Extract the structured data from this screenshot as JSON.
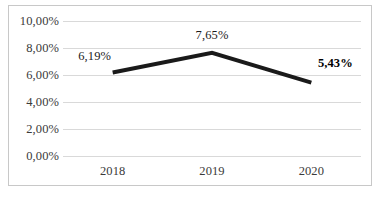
{
  "chart_data": {
    "type": "line",
    "title": "",
    "subtitle": "",
    "xlabel": "",
    "ylabel": "",
    "categories": [
      "2018",
      "2019",
      "2020"
    ],
    "values": [
      6.19,
      7.65,
      5.43
    ],
    "point_labels": [
      "6,19%",
      "7,65%",
      "5,43%"
    ],
    "point_label_styles": [
      "regular",
      "regular",
      "bold"
    ],
    "ylim": [
      0,
      10
    ],
    "ytick_values": [
      10,
      8,
      6,
      4,
      2,
      0
    ],
    "ytick_labels": [
      "10,00%",
      "8,00%",
      "6,00%",
      "4,00%",
      "2,00%",
      "0,00%"
    ],
    "decimal_separator": ",",
    "unit": "%",
    "grid": true,
    "grid_axis": "y",
    "legend": false,
    "legend_position": "none",
    "markers": false,
    "series": [
      {
        "name": "",
        "values": [
          6.19,
          7.65,
          5.43
        ],
        "color": "#1a1a1a",
        "line_width_px": 4
      }
    ]
  },
  "style": {
    "background": "#ffffff",
    "border_color": "#c8c8c8",
    "gridline_color": "#d9d9d9",
    "tick_label_color": "#3a3a3a",
    "line_color": "#1a1a1a"
  }
}
